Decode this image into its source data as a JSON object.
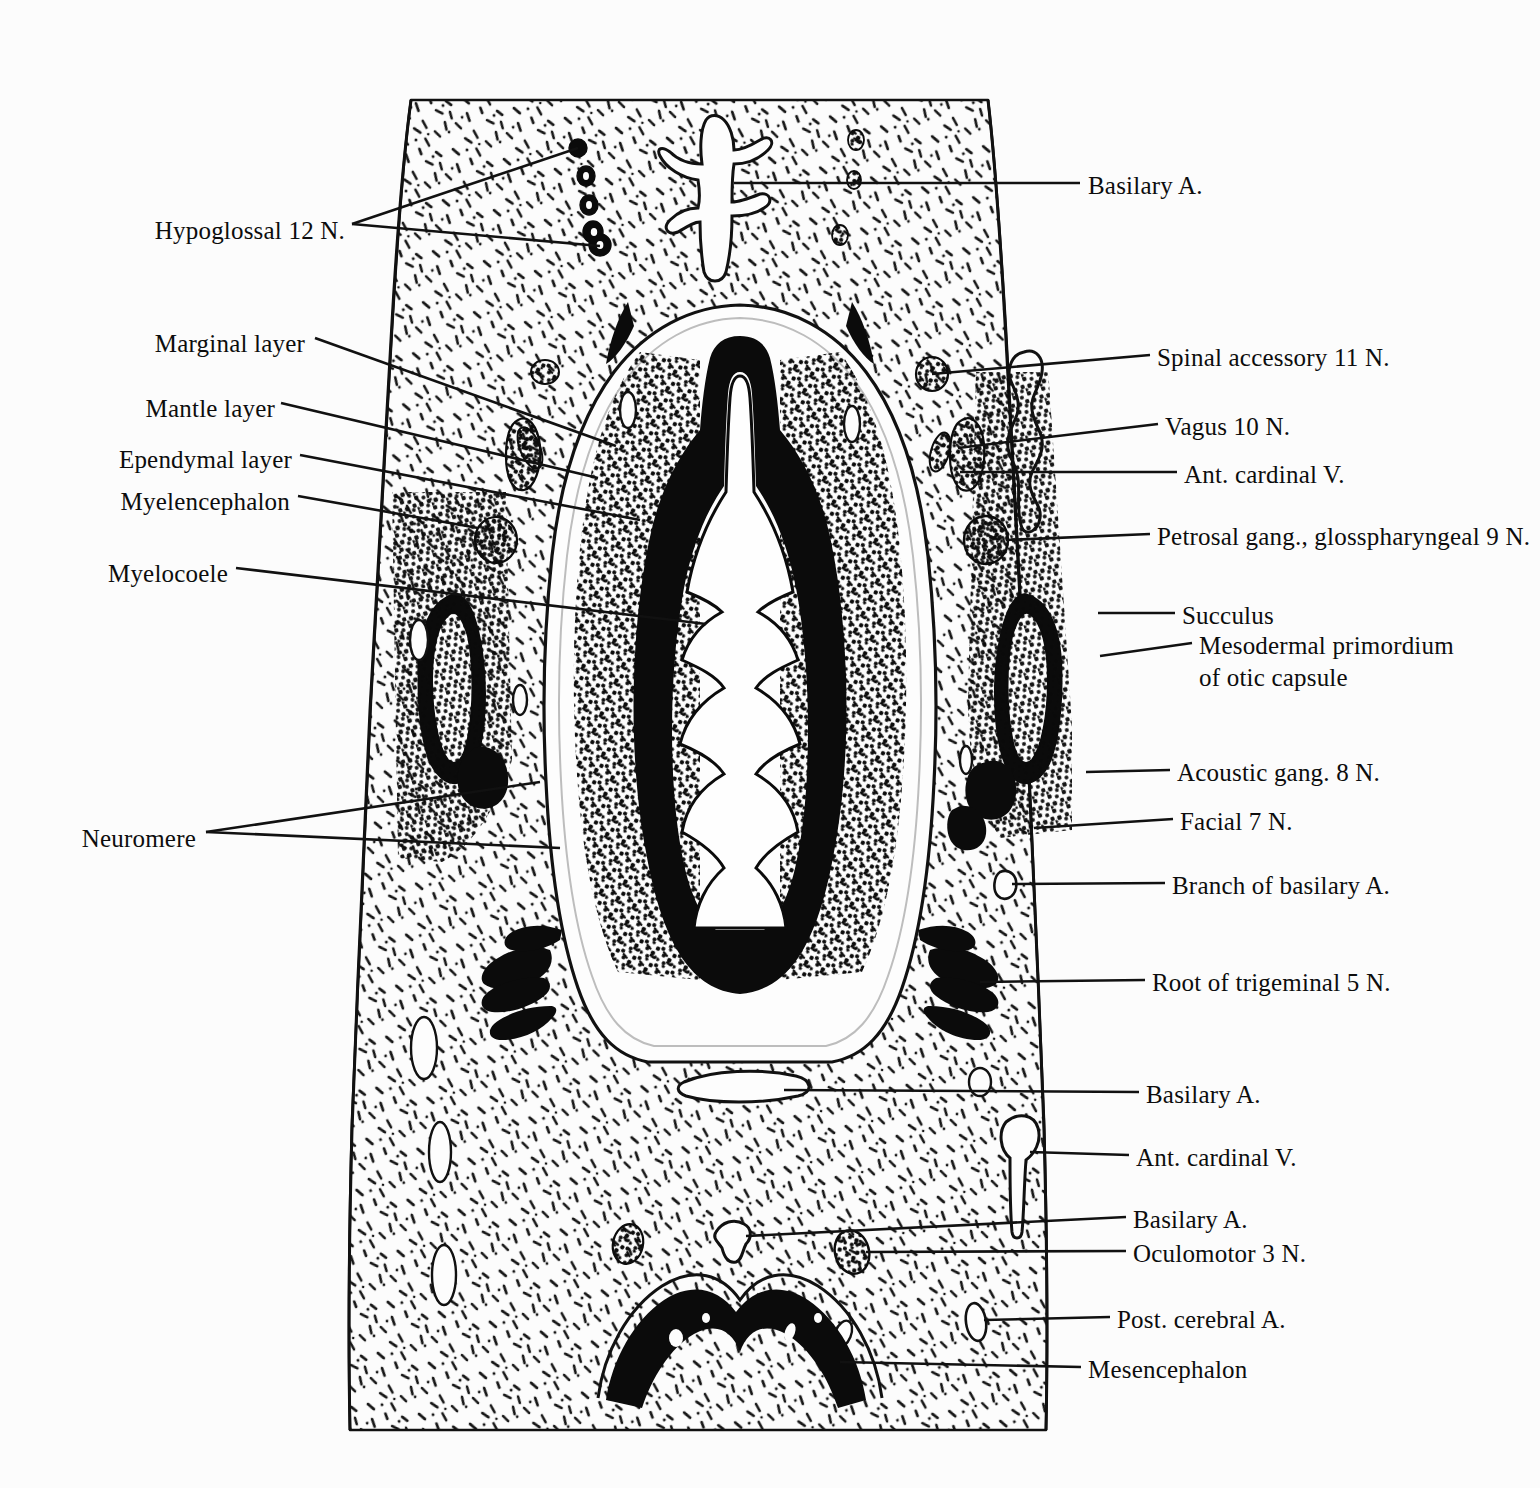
{
  "figure": {
    "type": "anatomical-line-drawing",
    "background_color": "#fcfcfc",
    "ink_color": "#111111",
    "paper_tone": "#fdfdfd"
  },
  "labels_left": [
    {
      "id": "hypoglossal",
      "text": "Hypoglossal 12 N.",
      "x": 345,
      "y": 232
    },
    {
      "id": "marginal",
      "text": "Marginal layer",
      "x": 305,
      "y": 345
    },
    {
      "id": "mantle",
      "text": "Mantle layer",
      "x": 275,
      "y": 410
    },
    {
      "id": "ependymal",
      "text": "Ependymal layer",
      "x": 292,
      "y": 461
    },
    {
      "id": "myelencephalon",
      "text": "Myelencephalon",
      "x": 290,
      "y": 503
    },
    {
      "id": "myelocoele",
      "text": "Myelocoele",
      "x": 228,
      "y": 575
    },
    {
      "id": "neuromere",
      "text": "Neuromere",
      "x": 196,
      "y": 840
    }
  ],
  "labels_right": [
    {
      "id": "basilary-a-top",
      "text": "Basilary A.",
      "x": 1088,
      "y": 188
    },
    {
      "id": "spinal-accessory",
      "text": "Spinal accessory 11 N.",
      "x": 1157,
      "y": 360
    },
    {
      "id": "vagus",
      "text": "Vagus 10 N.",
      "x": 1165,
      "y": 429
    },
    {
      "id": "ant-cardinal-v-top",
      "text": "Ant. cardinal V.",
      "x": 1184,
      "y": 477
    },
    {
      "id": "petrosal",
      "text": "Petrosal gang., glosspharyngeal 9 N.",
      "x": 1157,
      "y": 539
    },
    {
      "id": "succulus",
      "text": "Succulus",
      "x": 1182,
      "y": 618
    },
    {
      "id": "mesodermal-1",
      "text": "Mesodermal primordium",
      "x": 1199,
      "y": 648
    },
    {
      "id": "mesodermal-2",
      "text": "of otic capsule",
      "x": 1199,
      "y": 680
    },
    {
      "id": "acoustic",
      "text": "Acoustic gang. 8 N.",
      "x": 1177,
      "y": 775
    },
    {
      "id": "facial",
      "text": "Facial 7 N.",
      "x": 1180,
      "y": 824
    },
    {
      "id": "branch-basilary",
      "text": "Branch of basilary A.",
      "x": 1172,
      "y": 888
    },
    {
      "id": "root-trigeminal",
      "text": "Root of trigeminal 5 N.",
      "x": 1152,
      "y": 985
    },
    {
      "id": "basilary-a-mid",
      "text": "Basilary A.",
      "x": 1146,
      "y": 1097
    },
    {
      "id": "ant-cardinal-v-low",
      "text": "Ant. cardinal V.",
      "x": 1136,
      "y": 1160
    },
    {
      "id": "basilary-a-low",
      "text": "Basilary A.",
      "x": 1133,
      "y": 1222
    },
    {
      "id": "oculomotor",
      "text": "Oculomotor 3 N.",
      "x": 1133,
      "y": 1256
    },
    {
      "id": "post-cerebral",
      "text": "Post. cerebral A.",
      "x": 1117,
      "y": 1322
    },
    {
      "id": "mesencephalon",
      "text": "Mesencephalon",
      "x": 1088,
      "y": 1372
    }
  ]
}
